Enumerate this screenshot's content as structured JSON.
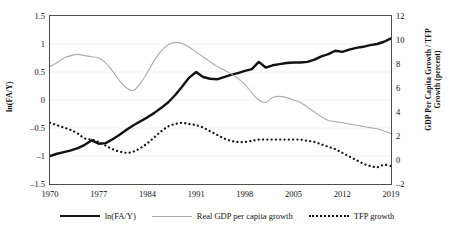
{
  "chart_data": {
    "type": "line",
    "title": "",
    "xlabel": "",
    "ylabel": "ln(FA/Y)",
    "y2label": "GDP Per Capita Growth / TFP Growth (percent)",
    "grid": true,
    "legend_position": "bottom",
    "xlim": [
      1970,
      2019
    ],
    "ylim": [
      -1.5,
      1.5
    ],
    "y2lim": [
      -2,
      12
    ],
    "xticks": [
      "1970",
      "1977",
      "1984",
      "1991",
      "1998",
      "2005",
      "2012",
      "2019"
    ],
    "yticks_left": [
      "1.5",
      "1",
      "0.5",
      "0",
      "-0.5",
      "-1",
      "-1.5"
    ],
    "yticks_right": [
      "12",
      "10",
      "8",
      "6",
      "4",
      "2",
      "0",
      "-2"
    ],
    "x": [
      1970,
      1971,
      1972,
      1973,
      1974,
      1975,
      1976,
      1977,
      1978,
      1979,
      1980,
      1981,
      1982,
      1983,
      1984,
      1985,
      1986,
      1987,
      1988,
      1989,
      1990,
      1991,
      1992,
      1993,
      1994,
      1995,
      1996,
      1997,
      1998,
      1999,
      2000,
      2001,
      2002,
      2003,
      2004,
      2005,
      2006,
      2007,
      2008,
      2009,
      2010,
      2011,
      2012,
      2013,
      2014,
      2015,
      2016,
      2017,
      2018,
      2019
    ],
    "series": [
      {
        "name": "ln(FA/Y)",
        "axis": "left",
        "style": "solid-thick-black",
        "color": "#111111",
        "values": [
          -1.0,
          -0.96,
          -0.93,
          -0.9,
          -0.86,
          -0.8,
          -0.72,
          -0.78,
          -0.77,
          -0.7,
          -0.62,
          -0.53,
          -0.45,
          -0.38,
          -0.31,
          -0.23,
          -0.14,
          -0.04,
          0.09,
          0.24,
          0.4,
          0.5,
          0.41,
          0.38,
          0.37,
          0.41,
          0.45,
          0.48,
          0.52,
          0.55,
          0.68,
          0.58,
          0.62,
          0.64,
          0.66,
          0.67,
          0.67,
          0.68,
          0.72,
          0.78,
          0.82,
          0.88,
          0.86,
          0.9,
          0.93,
          0.95,
          0.98,
          1.0,
          1.04,
          1.1
        ]
      },
      {
        "name": "Real GDP per capita growth",
        "axis": "right",
        "style": "solid-thin-gray",
        "color": "#aaaaaa",
        "values": [
          7.8,
          8.1,
          8.5,
          8.7,
          8.8,
          8.7,
          8.6,
          8.5,
          8.1,
          7.4,
          6.6,
          6.0,
          5.8,
          6.4,
          7.3,
          8.3,
          9.1,
          9.6,
          9.8,
          9.7,
          9.4,
          9.0,
          8.6,
          8.2,
          7.8,
          7.5,
          7.2,
          6.8,
          6.3,
          5.6,
          5.0,
          4.8,
          5.2,
          5.3,
          5.2,
          5.0,
          4.8,
          4.4,
          4.0,
          3.6,
          3.3,
          3.2,
          3.1,
          3.0,
          2.9,
          2.8,
          2.7,
          2.6,
          2.4,
          2.2
        ]
      },
      {
        "name": "TFP growth",
        "axis": "right",
        "style": "dotted-black",
        "color": "#111111",
        "values": [
          3.1,
          2.9,
          2.7,
          2.5,
          2.2,
          1.8,
          1.7,
          1.5,
          1.2,
          0.9,
          0.7,
          0.6,
          0.7,
          1.0,
          1.4,
          1.9,
          2.4,
          2.8,
          3.0,
          3.1,
          3.0,
          2.9,
          2.7,
          2.4,
          2.1,
          1.8,
          1.6,
          1.5,
          1.5,
          1.6,
          1.7,
          1.7,
          1.7,
          1.7,
          1.7,
          1.7,
          1.7,
          1.6,
          1.5,
          1.3,
          1.1,
          0.9,
          0.6,
          0.3,
          0.0,
          -0.3,
          -0.5,
          -0.6,
          -0.4,
          -0.5
        ]
      }
    ]
  },
  "legend": {
    "items": [
      {
        "label": "ln(FA/Y)",
        "style": "solid-thick-black"
      },
      {
        "label": "Real GDP per capita growth",
        "style": "solid-thin-gray"
      },
      {
        "label": "TFP growth",
        "style": "dotted-black"
      }
    ]
  },
  "axes": {
    "left_title": "ln(FA/Y)",
    "right_title": "GDP Per Capita Growth / TFP Growth (percent)"
  }
}
